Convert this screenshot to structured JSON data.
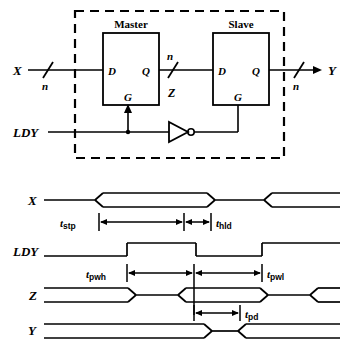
{
  "figure": {
    "ink_color": "#000000",
    "background": "#ffffff"
  },
  "schematic": {
    "enclosure": {
      "style": "dashed",
      "label": ""
    },
    "blocks": [
      {
        "name": "master",
        "title": "Master",
        "pin_d": "D",
        "pin_q": "Q",
        "pin_g": "G"
      },
      {
        "name": "slave",
        "title": "Slave",
        "pin_d": "D",
        "pin_q": "Q",
        "pin_g": "G"
      }
    ],
    "signals": {
      "input_x": "X",
      "input_ldy": "LDY",
      "output_y": "Y",
      "internal_z": "Z"
    },
    "bus_widths": {
      "x_in": "n",
      "z_mid": "n",
      "y_out": "n"
    },
    "inverter": {
      "name": "not-gate",
      "label": ""
    }
  },
  "timing": {
    "rows": [
      {
        "name": "x",
        "label": "X"
      },
      {
        "name": "ldy",
        "label": "LDY"
      },
      {
        "name": "z",
        "label": "Z"
      },
      {
        "name": "y",
        "label": "Y"
      }
    ],
    "measurements": [
      {
        "name": "t-setup",
        "base": "t",
        "sub": "stp"
      },
      {
        "name": "t-hold",
        "base": "t",
        "sub": "hld"
      },
      {
        "name": "t-pulse-high",
        "base": "t",
        "sub": "pwh"
      },
      {
        "name": "t-pulse-low",
        "base": "t",
        "sub": "pwl"
      },
      {
        "name": "t-prop-delay",
        "base": "t",
        "sub": "pd"
      }
    ]
  }
}
